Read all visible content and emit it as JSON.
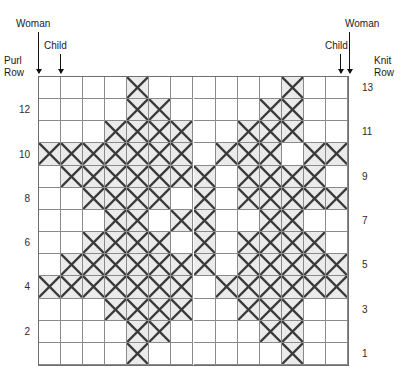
{
  "chart_data": {
    "type": "heatmap",
    "title": "",
    "subtitle": "",
    "xlabel": "",
    "ylabel": "",
    "grid": true,
    "legend_position": "none",
    "columns": 14,
    "rows": 13,
    "row_labels_left": [
      "12",
      "10",
      "8",
      "6",
      "4",
      "2"
    ],
    "row_labels_right": [
      "13",
      "11",
      "9",
      "7",
      "5",
      "3",
      "1"
    ],
    "row_order_top_to_bottom": [
      13,
      12,
      11,
      10,
      9,
      8,
      7,
      6,
      5,
      4,
      3,
      2,
      1
    ],
    "cell_fill_color": "#ebebeb",
    "cell_mark": "X",
    "grid_line_color": "#8a8a8a",
    "border_color": "#6e6e6e",
    "cells": [
      [
        0,
        0,
        0,
        0,
        1,
        0,
        0,
        0,
        0,
        0,
        0,
        1,
        0,
        0
      ],
      [
        0,
        0,
        0,
        0,
        1,
        1,
        0,
        0,
        0,
        0,
        1,
        1,
        0,
        0
      ],
      [
        0,
        0,
        0,
        1,
        1,
        1,
        1,
        0,
        0,
        1,
        1,
        1,
        0,
        0
      ],
      [
        1,
        1,
        1,
        1,
        1,
        1,
        1,
        0,
        1,
        1,
        1,
        0,
        1,
        1
      ],
      [
        0,
        1,
        1,
        1,
        1,
        1,
        1,
        1,
        0,
        1,
        1,
        1,
        1,
        0
      ],
      [
        0,
        0,
        1,
        1,
        1,
        1,
        0,
        1,
        0,
        1,
        1,
        1,
        1,
        1
      ],
      [
        0,
        0,
        0,
        1,
        1,
        0,
        1,
        1,
        0,
        0,
        1,
        1,
        0,
        0
      ],
      [
        0,
        0,
        1,
        1,
        1,
        1,
        0,
        1,
        0,
        1,
        1,
        1,
        1,
        0
      ],
      [
        0,
        1,
        1,
        1,
        1,
        1,
        1,
        1,
        0,
        1,
        1,
        1,
        1,
        1
      ],
      [
        1,
        1,
        1,
        1,
        1,
        1,
        1,
        0,
        1,
        1,
        1,
        1,
        1,
        1
      ],
      [
        0,
        0,
        0,
        1,
        1,
        1,
        1,
        0,
        0,
        1,
        1,
        1,
        0,
        0
      ],
      [
        0,
        0,
        0,
        0,
        1,
        1,
        0,
        0,
        0,
        0,
        1,
        1,
        0,
        0
      ],
      [
        0,
        0,
        0,
        0,
        1,
        0,
        0,
        0,
        0,
        0,
        0,
        1,
        0,
        0
      ]
    ]
  },
  "annotations": {
    "left_woman": "Woman",
    "left_child": "Child",
    "right_child": "Child",
    "right_woman": "Woman",
    "purl_row_line1": "Purl",
    "purl_row_line2": "Row",
    "knit_row_line1": "Knit",
    "knit_row_line2": "Row"
  }
}
